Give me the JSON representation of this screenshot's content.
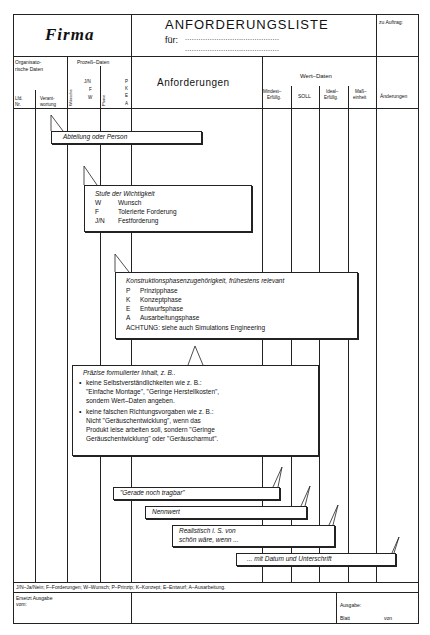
{
  "header": {
    "company": "Firma",
    "title": "ANFORDERUNGSLISTE",
    "for_label": "für:",
    "for_dots_1": "..........................................",
    "for_dots_2": "..........................................",
    "order_label": "zu Auftrag:"
  },
  "columns": {
    "org_group": "Organisato-\nrische Daten",
    "org_group_1": "Organisato-",
    "org_group_2": "rische Daten",
    "lfd": "Lfd.",
    "nr": "Nr.",
    "verant_1": "Verant-",
    "verant_2": "wortung",
    "process_group": "Prozeß–Daten",
    "importance_codes": [
      "J/N",
      "F",
      "W"
    ],
    "phase_codes": [
      "P",
      "K",
      "E",
      "A"
    ],
    "vert_1": "Wünsche",
    "vert_2": "Phase",
    "requirements": "Anforderungen",
    "value_group": "Wert–Daten",
    "min_1": "Mindest–",
    "min_2": "Erfüllg.",
    "soll": "SOLL",
    "ideal_1": "Ideal–",
    "ideal_2": "Erfüllg.",
    "unit_1": "Maß–",
    "unit_2": "einheit",
    "changes": "Änderungen"
  },
  "callouts": {
    "department": "Abteilung oder Person",
    "importance": {
      "title": "Stufe der Wichtigkeit",
      "items": [
        {
          "code": "W",
          "label": "Wunsch"
        },
        {
          "code": "F",
          "label": "Tolerierte Forderung"
        },
        {
          "code": "J/N",
          "label": "Festforderung"
        }
      ]
    },
    "phase": {
      "title": "Konstruktionsphasenzugehörigkeit, frühestens relevant",
      "items": [
        {
          "code": "P",
          "label": "Prinzipphase"
        },
        {
          "code": "K",
          "label": "Konzeptphase"
        },
        {
          "code": "E",
          "label": "Entwurfsphase"
        },
        {
          "code": "A",
          "label": "Ausarbeitungsphase"
        }
      ],
      "note": "ACHTUNG: siehe auch Simulations Engineering"
    },
    "precise": {
      "title": "Präzise formulierter Inhalt, z. B..",
      "bullet1": [
        "keine Selbstverständlichkeiten wie z. B.:",
        "\"Einfache Montage\", \"Geringe Herstellkosten\",",
        "sondern Wert–Daten angeben."
      ],
      "bullet2": [
        "keine falschen Richtungsvorgaben wie z. B.:",
        "Nicht \"Geräuschentwicklung\", wenn das",
        "Produkt leise arbeiten soll, sondern \"Geringe",
        "Geräuschentwicklung\" oder \"Geräuscharmut\"."
      ]
    },
    "min_value": "\"Gerade noch tragbar\"",
    "nominal": "Nennwert",
    "ideal": [
      "Realistisch i. S. von",
      "schön wäre, wenn ..."
    ],
    "signature": "... mit Datum und Unterschrift"
  },
  "footer": {
    "legend": "J/N–Ja/Nein; F–Forderungen; W–Wunsch; P–Prinzip; K–Konzept; E–Entwurf; A–Ausarbeitung.",
    "replaces_1": "Ersetzt Ausgabe",
    "replaces_2": "vom:",
    "issue": "Ausgabe:",
    "sheet": "Blatt",
    "of": "von"
  }
}
